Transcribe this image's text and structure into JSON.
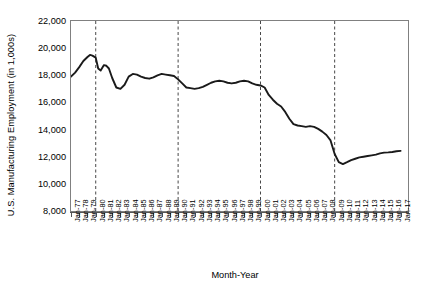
{
  "chart_data": {
    "type": "line",
    "title": "",
    "xlabel": "Month-Year",
    "ylabel": "U.S. Manufacturing Employment (in 1,000s)",
    "ylim": [
      8000,
      22000
    ],
    "ytick_values": [
      22000,
      20000,
      18000,
      16000,
      14000,
      12000,
      10000,
      8000
    ],
    "ytick_labels": [
      "22,000",
      "20,000",
      "18,000",
      "16,000",
      "14,000",
      "12,000",
      "10,000",
      "8,000"
    ],
    "xtick_labels": [
      "Jan-77",
      "Jan-78",
      "Jan-79",
      "Jan-80",
      "Jan-81",
      "Jan-82",
      "Jan-83",
      "Jan-84",
      "Jan-85",
      "Jan-86",
      "Jan-87",
      "Jan-88",
      "Jan-89",
      "Jan-90",
      "Jan-91",
      "Jan-92",
      "Jan-93",
      "Jan-94",
      "Jan-95",
      "Jan-96",
      "Jan-97",
      "Jan-98",
      "Jan-99",
      "Jan-00",
      "Jan-01",
      "Jan-02",
      "Jan-03",
      "Jan-04",
      "Jan-05",
      "Jan-06",
      "Jan-07",
      "Jan-08",
      "Jan-09",
      "Jan-10",
      "Jan-11",
      "Jan-12",
      "Jan-13",
      "Jan-14",
      "Jan-15",
      "Jan-16",
      "Jan-17"
    ],
    "grid": false,
    "legend": "none",
    "line_color": "#1a1a1a",
    "axis_color": "#808080",
    "reference_lines": [
      {
        "label": "Jan-80",
        "x": 1980.0,
        "style": "dashed"
      },
      {
        "label": "Jan-90",
        "x": 1990.0,
        "style": "dashed"
      },
      {
        "label": "Jan-00",
        "x": 2000.0,
        "style": "dashed"
      },
      {
        "label": "Jan-09",
        "x": 2009.0,
        "style": "dashed"
      }
    ],
    "series": [
      {
        "name": "U.S. Manufacturing Employment",
        "x": [
          1977.0,
          1977.5,
          1978.0,
          1978.5,
          1979.0,
          1979.3,
          1979.6,
          1980.0,
          1980.3,
          1980.6,
          1981.0,
          1981.3,
          1981.6,
          1982.0,
          1982.5,
          1983.0,
          1983.5,
          1984.0,
          1984.5,
          1985.0,
          1985.5,
          1986.0,
          1986.5,
          1987.0,
          1987.5,
          1988.0,
          1988.5,
          1989.0,
          1989.5,
          1990.0,
          1990.5,
          1991.0,
          1991.5,
          1992.0,
          1992.5,
          1993.0,
          1993.5,
          1994.0,
          1994.5,
          1995.0,
          1995.5,
          1996.0,
          1996.5,
          1997.0,
          1997.5,
          1998.0,
          1998.5,
          1999.0,
          1999.5,
          2000.0,
          2000.5,
          2001.0,
          2001.5,
          2002.0,
          2002.5,
          2003.0,
          2003.5,
          2004.0,
          2004.5,
          2005.0,
          2005.5,
          2006.0,
          2006.5,
          2007.0,
          2007.5,
          2008.0,
          2008.5,
          2009.0,
          2009.5,
          2010.0,
          2010.5,
          2011.0,
          2011.5,
          2012.0,
          2012.5,
          2013.0,
          2013.5,
          2014.0,
          2014.5,
          2015.0,
          2015.5,
          2016.0,
          2016.5,
          2017.0
        ],
        "y": [
          17900,
          18200,
          18600,
          19050,
          19350,
          19500,
          19450,
          19300,
          18500,
          18350,
          18750,
          18700,
          18500,
          17800,
          17100,
          17000,
          17300,
          17900,
          18100,
          18050,
          17900,
          17800,
          17750,
          17850,
          18000,
          18100,
          18050,
          18000,
          17950,
          17700,
          17400,
          17100,
          17050,
          17000,
          17050,
          17150,
          17300,
          17450,
          17550,
          17600,
          17550,
          17450,
          17400,
          17450,
          17550,
          17600,
          17550,
          17400,
          17300,
          17250,
          17100,
          16550,
          16200,
          15900,
          15700,
          15300,
          14800,
          14400,
          14300,
          14250,
          14200,
          14250,
          14200,
          14050,
          13850,
          13600,
          13200,
          12200,
          11600,
          11460,
          11600,
          11750,
          11850,
          11950,
          12000,
          12050,
          12100,
          12150,
          12250,
          12300,
          12320,
          12350,
          12400,
          12430
        ]
      }
    ]
  }
}
